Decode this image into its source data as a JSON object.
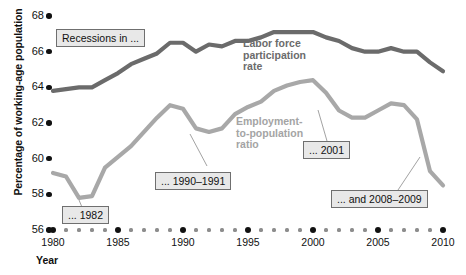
{
  "chart_data": {
    "type": "line",
    "title": "",
    "xlabel": "Year",
    "ylabel": "Percentage of working-age population",
    "xlim": [
      1980,
      2010
    ],
    "ylim": [
      56,
      68
    ],
    "ytick_labels": [
      "68",
      "66",
      "64",
      "62",
      "60",
      "58",
      "56"
    ],
    "yticks": [
      68,
      66,
      64,
      62,
      60,
      58,
      56
    ],
    "xtick_labels": [
      "1980",
      "1985",
      "1990",
      "1995",
      "2000",
      "2005",
      "2010"
    ],
    "xticks": [
      1980,
      1985,
      1990,
      1995,
      2000,
      2005,
      2010
    ],
    "grid": false,
    "legend": "inline-labels",
    "x": [
      1980,
      1981,
      1982,
      1983,
      1984,
      1985,
      1986,
      1987,
      1988,
      1989,
      1990,
      1991,
      1992,
      1993,
      1994,
      1995,
      1996,
      1997,
      1998,
      1999,
      2000,
      2001,
      2002,
      2003,
      2004,
      2005,
      2006,
      2007,
      2008,
      2009,
      2010
    ],
    "series": [
      {
        "name": "Labor force participation rate",
        "color": "#6b6b6b",
        "values": [
          63.8,
          63.9,
          64.0,
          64.0,
          64.4,
          64.8,
          65.3,
          65.6,
          65.9,
          66.5,
          66.5,
          66.0,
          66.4,
          66.3,
          66.6,
          66.6,
          66.8,
          67.1,
          67.1,
          67.1,
          67.1,
          66.8,
          66.6,
          66.2,
          66.0,
          66.0,
          66.2,
          66.0,
          66.0,
          65.4,
          64.9
        ]
      },
      {
        "name": "Employment-to-population ratio",
        "color": "#a8a8a8",
        "values": [
          59.2,
          59.0,
          57.8,
          57.9,
          59.5,
          60.1,
          60.7,
          61.5,
          62.3,
          63.0,
          62.8,
          61.7,
          61.5,
          61.7,
          62.5,
          62.9,
          63.2,
          63.8,
          64.1,
          64.3,
          64.4,
          63.7,
          62.7,
          62.3,
          62.3,
          62.7,
          63.1,
          63.0,
          62.2,
          59.3,
          58.5
        ]
      }
    ],
    "annotations": [
      {
        "name": "recessions-in",
        "text": "Recessions in ..."
      },
      {
        "name": "recession-1982",
        "text": "... 1982"
      },
      {
        "name": "recession-1990-1991",
        "text": "... 1990–1991"
      },
      {
        "name": "recession-2001",
        "text": "... 2001"
      },
      {
        "name": "recession-2008-2009",
        "text": "... and 2008–2009"
      }
    ]
  },
  "axes": {
    "y_title": "Percentage of working-age population",
    "x_title": "Year",
    "y_labels": [
      "68",
      "66",
      "64",
      "62",
      "60",
      "58",
      "56"
    ],
    "x_labels": [
      "1980",
      "1985",
      "1990",
      "1995",
      "2000",
      "2005",
      "2010"
    ]
  },
  "series_labels": {
    "labor_force": "Labor force\nparticipation\nrate",
    "labor_force_l1": "Labor force",
    "labor_force_l2": "participation",
    "labor_force_l3": "rate",
    "employment_l1": "Employment-",
    "employment_l2": "to-population",
    "employment_l3": "ratio"
  },
  "callouts": {
    "recessions_in": "Recessions in ...",
    "y1982": "... 1982",
    "y1990_1991": "... 1990–1991",
    "y2001": "... 2001",
    "y2008_2009": "... and 2008–2009"
  },
  "colors": {
    "labor_force_line": "#6b6b6b",
    "employment_line": "#a8a8a8",
    "callout_bg": "#e8e8e8",
    "callout_border": "#6f6f6f",
    "axis_mark": "#111111"
  }
}
